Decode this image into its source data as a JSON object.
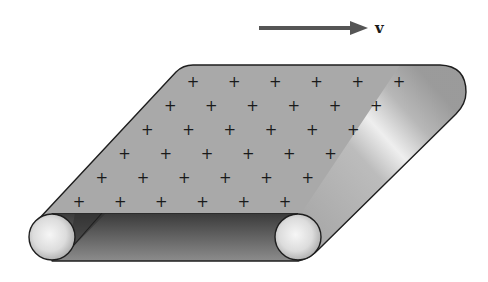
{
  "diagram": {
    "velocity": {
      "label": "v",
      "direction": "right"
    },
    "belt": {
      "surface_charge_sign": "+",
      "charge_grid": {
        "rows": 6,
        "columns": 6
      },
      "colors": {
        "surface": "#a9a9a9",
        "underside_dark": "#3a3a3a",
        "underside_light": "#8c8c8c",
        "outline": "#1e1e1e",
        "highlight": "#f2f2f2"
      }
    },
    "rollers": [
      {
        "name": "left-roller"
      },
      {
        "name": "right-roller"
      }
    ],
    "arrow_color": "#555555"
  }
}
